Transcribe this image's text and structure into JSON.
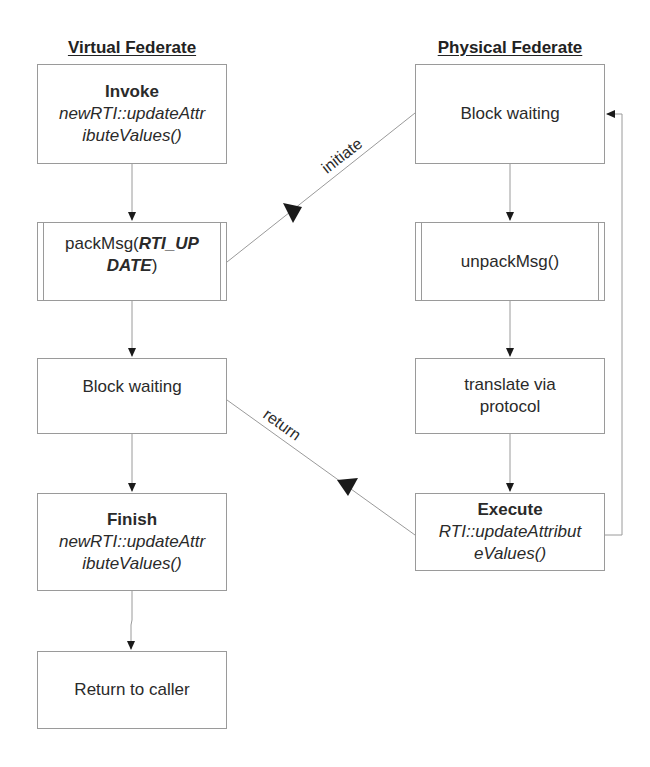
{
  "columns": {
    "virtual": {
      "title": "Virtual Federate",
      "steps": [
        {
          "bold": "Invoke",
          "italic_lines": [
            "newRTI::updateAttr",
            "ibuteValues()"
          ]
        },
        {
          "prefix": "packMsg(",
          "bold_italic_1": "RTI_UP",
          "bold_italic_2": "DATE",
          "suffix": ")",
          "shape": "predefined-process"
        },
        {
          "text": "Block waiting"
        },
        {
          "bold": "Finish",
          "italic_lines": [
            "newRTI::updateAttr",
            "ibuteValues()"
          ]
        },
        {
          "text": "Return to caller"
        }
      ]
    },
    "physical": {
      "title": "Physical Federate",
      "steps": [
        {
          "text": "Block waiting"
        },
        {
          "text": "unpackMsg()",
          "shape": "predefined-process"
        },
        {
          "lines": [
            "translate via",
            "protocol"
          ]
        },
        {
          "bold": "Execute",
          "italic_lines": [
            "RTI::updateAttribut",
            "eValues()"
          ]
        }
      ]
    }
  },
  "edges": {
    "initiate": {
      "label": "initiate",
      "from": "packMsg",
      "to": "Physical Block waiting"
    },
    "return": {
      "label": "return",
      "from": "Execute",
      "to": "Virtual Block waiting"
    },
    "loop": {
      "from": "Execute",
      "to": "Physical Block waiting"
    }
  },
  "colors": {
    "line": "#9a9a9a",
    "arrow": "#1a1a1a",
    "text": "#222222"
  }
}
